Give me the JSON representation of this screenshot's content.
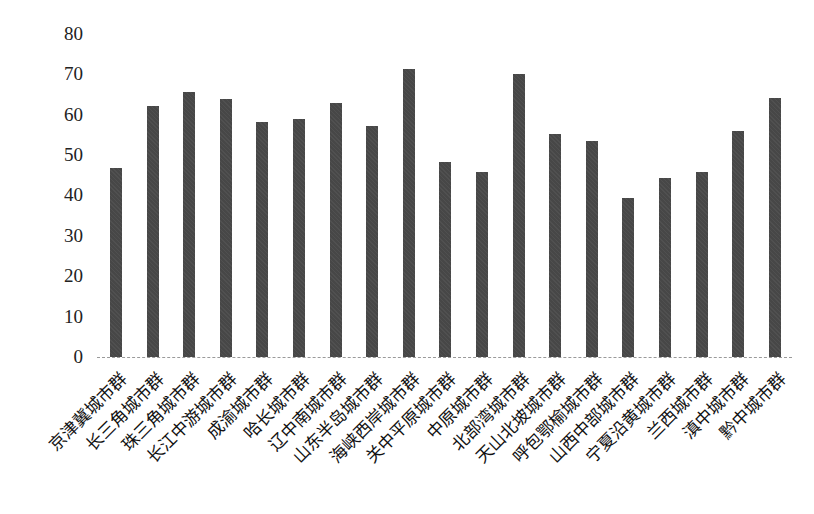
{
  "chart_data": {
    "type": "bar",
    "title": "",
    "xlabel": "",
    "ylabel": "",
    "ylim": [
      0,
      80
    ],
    "yticks": [
      0,
      10,
      20,
      30,
      40,
      50,
      60,
      70,
      80
    ],
    "grid": false,
    "legend": null,
    "categories": [
      "京津冀城市群",
      "长三角城市群",
      "珠三角城市群",
      "长江中游城市群",
      "成渝城市群",
      "哈长城市群",
      "辽中南城市群",
      "山东半岛城市群",
      "海峡西岸城市群",
      "关中平原城市群",
      "中原城市群",
      "北部湾城市群",
      "天山北坡城市群",
      "呼包鄂榆城市群",
      "山西中部城市群",
      "宁夏沿黄城市群",
      "兰西城市群",
      "滇中城市群",
      "黔中城市群"
    ],
    "values": [
      46.9,
      62.1,
      65.7,
      63.9,
      58.1,
      58.8,
      62.8,
      57.2,
      71.2,
      48.3,
      45.7,
      70.0,
      55.2,
      53.4,
      39.4,
      44.2,
      45.9,
      56.0,
      64.2
    ],
    "colors": {
      "bar": "#474747",
      "axis": "#9a9a9a",
      "text": "#222222"
    }
  }
}
